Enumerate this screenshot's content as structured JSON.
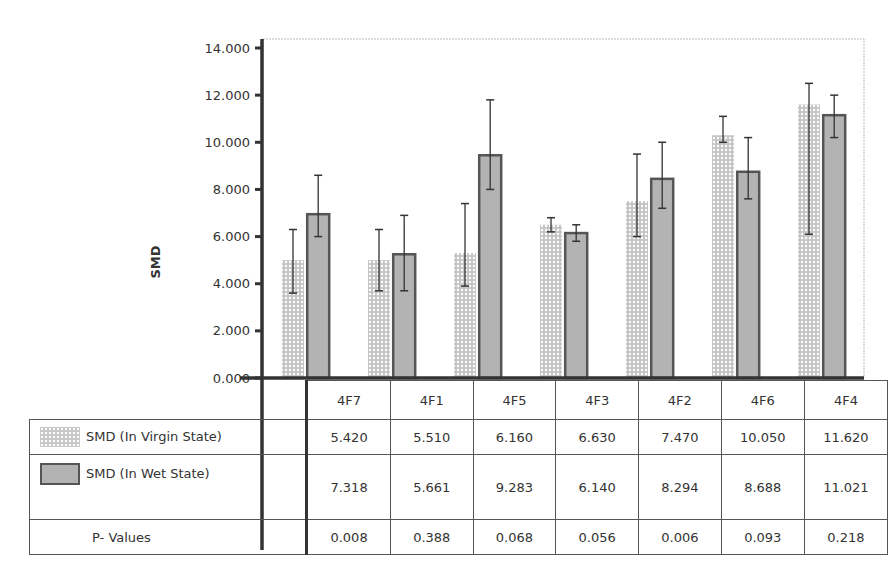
{
  "chart_data": {
    "type": "bar",
    "title": "",
    "xlabel": "",
    "ylabel": "SMD",
    "ylim": [
      0,
      14
    ],
    "yticks": [
      "0.000",
      "2.000",
      "4.000",
      "6.000",
      "8.000",
      "10.000",
      "12.000",
      "14.000"
    ],
    "grid": false,
    "legend_position": "data-table-left",
    "categories": [
      "4F7",
      "4F1",
      "4F5",
      "4F3",
      "4F2",
      "4F6",
      "4F4"
    ],
    "series": [
      {
        "name": "SMD (In Virgin State)",
        "pattern": "dotted",
        "values": [
          5.42,
          5.51,
          6.16,
          6.63,
          7.47,
          10.05,
          11.62
        ],
        "plotted_heights": [
          5.0,
          5.0,
          5.3,
          6.5,
          7.5,
          10.3,
          11.6
        ],
        "error_low": [
          3.6,
          3.7,
          3.9,
          6.2,
          6.0,
          10.0,
          6.1
        ],
        "error_high": [
          6.3,
          6.3,
          7.4,
          6.8,
          9.5,
          11.1,
          12.5
        ]
      },
      {
        "name": "SMD (In Wet State)",
        "pattern": "solid-gray-outlined",
        "values": [
          7.318,
          5.661,
          9.283,
          6.14,
          8.294,
          8.688,
          11.021
        ],
        "plotted_heights": [
          7.0,
          5.3,
          9.5,
          6.2,
          8.5,
          8.8,
          11.2
        ],
        "error_low": [
          6.0,
          3.7,
          8.0,
          5.8,
          7.2,
          7.6,
          10.2
        ],
        "error_high": [
          8.6,
          6.9,
          11.8,
          6.5,
          10.0,
          10.2,
          12.0
        ]
      },
      {
        "name": "P- Values",
        "values": [
          0.008,
          0.388,
          0.068,
          0.056,
          0.006,
          0.093,
          0.218
        ]
      }
    ]
  },
  "table": {
    "categories": [
      "4F7",
      "4F1",
      "4F5",
      "4F3",
      "4F2",
      "4F6",
      "4F4"
    ],
    "rows": [
      {
        "label": "SMD (In Virgin State)",
        "values": [
          "5.420",
          "5.510",
          "6.160",
          "6.630",
          "7.470",
          "10.050",
          "11.620"
        ]
      },
      {
        "label": "SMD (In Wet State)",
        "values": [
          "7.318",
          "5.661",
          "9.283",
          "6.140",
          "8.294",
          "8.688",
          "11.021"
        ]
      },
      {
        "label": "P- Values",
        "values": [
          "0.008",
          "0.388",
          "0.068",
          "0.056",
          "0.006",
          "0.093",
          "0.218"
        ]
      }
    ]
  },
  "colors": {
    "virgin_fill": "#c8c8c8",
    "wet_fill": "#b3b3b3",
    "wet_border": "#555555",
    "axis": "#333333",
    "plot_border": "#bbbbbb"
  }
}
